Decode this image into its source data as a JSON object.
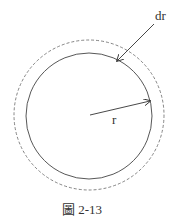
{
  "diagram": {
    "labels": {
      "dr": "dr",
      "r": "r"
    },
    "caption": "圖 2-13",
    "colors": {
      "stroke": "#444444",
      "dashed": "#666666"
    }
  }
}
